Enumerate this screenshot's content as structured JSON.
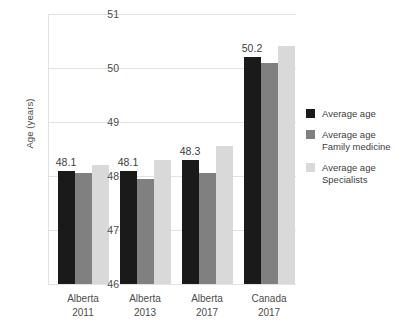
{
  "chart_data": {
    "type": "bar",
    "title": "",
    "subtitle": "",
    "xlabel": "",
    "ylabel": "Age (years)",
    "ylim": [
      46,
      51
    ],
    "ytick_labels": [
      "51",
      "50",
      "49",
      "48",
      "47",
      "46"
    ],
    "ytick_values": [
      51,
      50,
      49,
      48,
      47,
      46
    ],
    "grid": true,
    "legend_position": "right",
    "categories": [
      "Alberta 2011",
      "Alberta 2013",
      "Alberta 2017",
      "Canada 2017"
    ],
    "category_lines": [
      [
        "Alberta",
        "2011"
      ],
      [
        "Alberta",
        "2013"
      ],
      [
        "Alberta",
        "2017"
      ],
      [
        "Canada",
        "2017"
      ]
    ],
    "series": [
      {
        "name": "Average age",
        "color": "#1a1a1a",
        "values": [
          48.1,
          48.1,
          48.3,
          50.2
        ],
        "data_labels": [
          "48.1",
          "48.1",
          "48.3",
          "50.2"
        ]
      },
      {
        "name": "Average age Family medicine",
        "name_lines": [
          "Average age",
          "Family medicine"
        ],
        "color": "#808080",
        "values": [
          48.05,
          47.95,
          48.05,
          50.1
        ],
        "data_labels": [
          "",
          "",
          "",
          ""
        ]
      },
      {
        "name": "Average age Specialists",
        "name_lines": [
          "Average age",
          "Specialists"
        ],
        "color": "#d9d9d9",
        "values": [
          48.2,
          48.3,
          48.55,
          50.4
        ],
        "data_labels": [
          "",
          "",
          "",
          ""
        ]
      }
    ]
  },
  "legend": {
    "items": [
      {
        "label": "Average age",
        "line1": "Average age",
        "line2": "",
        "color": "#1a1a1a"
      },
      {
        "label": "Average age Family medicine",
        "line1": "Average age",
        "line2": "Family medicine",
        "color": "#808080"
      },
      {
        "label": "Average age Specialists",
        "line1": "Average age",
        "line2": "Specialists",
        "color": "#d9d9d9"
      }
    ]
  },
  "axis": {
    "y_title": "Age (years)"
  },
  "colors": {
    "gridline": "#e2e2e2",
    "text": "#3d3d3d",
    "background": "#ffffff"
  }
}
